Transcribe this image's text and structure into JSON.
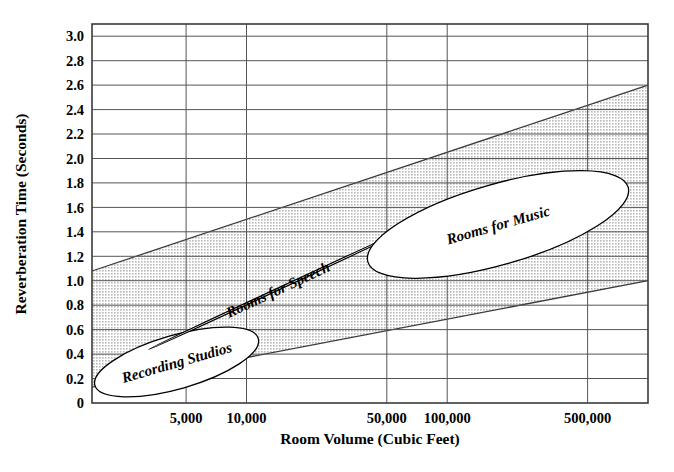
{
  "chart_data": {
    "type": "area",
    "title": "",
    "xlabel": "Room Volume  (Cubic Feet)",
    "ylabel": "Reverberation Time (Seconds)",
    "xscale": "log",
    "xlim": [
      1700,
      1000000
    ],
    "ylim": [
      0,
      3.1
    ],
    "grid": true,
    "legend_position": "none",
    "x_ticks": [
      {
        "value": 5000,
        "label": "5,000"
      },
      {
        "value": 10000,
        "label": "10,000"
      },
      {
        "value": 50000,
        "label": "50,000"
      },
      {
        "value": 100000,
        "label": "100,000"
      },
      {
        "value": 500000,
        "label": "500,000"
      }
    ],
    "y_ticks": [
      {
        "value": 3.0,
        "label": "3.0"
      },
      {
        "value": 2.8,
        "label": "2.8"
      },
      {
        "value": 2.6,
        "label": "2.6"
      },
      {
        "value": 2.4,
        "label": "2.4"
      },
      {
        "value": 2.2,
        "label": "2.2"
      },
      {
        "value": 2.0,
        "label": "2.0"
      },
      {
        "value": 1.8,
        "label": "1.8"
      },
      {
        "value": 1.6,
        "label": "1.6"
      },
      {
        "value": 1.4,
        "label": "1.4"
      },
      {
        "value": 1.2,
        "label": "1.2"
      },
      {
        "value": 1.0,
        "label": "1.0"
      },
      {
        "value": 0.8,
        "label": "0.8"
      },
      {
        "value": 0.6,
        "label": "0.6"
      },
      {
        "value": 0.4,
        "label": "0.4"
      },
      {
        "value": 0.2,
        "label": "0.2"
      },
      {
        "value": 0.0,
        "label": "0"
      }
    ],
    "series": [
      {
        "name": "Acceptable reverberation band",
        "type": "band",
        "fill": "#d9d9d9",
        "upper": [
          {
            "x": 1700,
            "y": 1.08
          },
          {
            "x": 1000000,
            "y": 2.6
          }
        ],
        "lower": [
          {
            "x": 1700,
            "y": 0.13
          },
          {
            "x": 1000000,
            "y": 1.0
          }
        ]
      }
    ],
    "annotations": [
      {
        "label": "Recording Studios",
        "shape": "ellipse",
        "x_range": [
          1750,
          11500
        ],
        "y_range": [
          0.05,
          0.62
        ],
        "center_x": 4500,
        "center_y": 0.33,
        "rotation_deg": -16
      },
      {
        "label": "Rooms for Speech",
        "shape": "ellipse",
        "x_range": [
          3300,
          62000
        ],
        "y_range": [
          0.52,
          1.34
        ],
        "center_x": 14500,
        "center_y": 0.93,
        "rotation_deg": -25
      },
      {
        "label": "Rooms for Music",
        "shape": "ellipse",
        "x_range": [
          40000,
          800000
        ],
        "y_range": [
          1.02,
          1.9
        ],
        "center_x": 180000,
        "center_y": 1.46,
        "rotation_deg": -16
      }
    ],
    "colors": {
      "band_fill": "#d9d9d9",
      "grid": "#555555",
      "frame": "#333333",
      "ellipse_fill": "#ffffff",
      "ellipse_stroke": "#000000",
      "text": "#000000"
    }
  }
}
